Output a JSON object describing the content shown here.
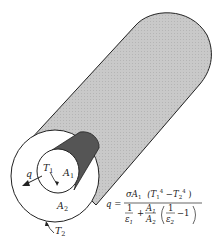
{
  "diagram": {
    "labels": {
      "heat_flow": "q",
      "inner_temp": "T",
      "inner_temp_sub": "1",
      "inner_area": "A",
      "inner_area_sub": "1",
      "outer_area": "A",
      "outer_area_sub": "2",
      "outer_temp": "T",
      "outer_temp_sub": "2"
    },
    "equation": {
      "lhs": "q =",
      "numerator": "σA₁ (T₁⁴ − T₂⁴)",
      "num_sigma_a": "σA",
      "num_sigma_a_sub": "1",
      "num_paren_open": "(T",
      "num_t1_sub": "1",
      "num_t1_sup": "4",
      "num_minus": " −T",
      "num_t2_sub": "2",
      "num_t2_sup": "4",
      "num_paren_close": ")",
      "den_one": "1",
      "den_eps1": "ε",
      "den_eps1_sub": "1",
      "den_plus": "+",
      "den_a1": "A",
      "den_a1_sub": "1",
      "den_a2": "A",
      "den_a2_sub": "2",
      "den_inner_one": "1",
      "den_eps2": "ε",
      "den_eps2_sub": "2",
      "den_minus_one": "−1"
    },
    "colors": {
      "outer_surface": "#c8c8c8",
      "inner_surface": "#555555",
      "annulus": "#ffffff",
      "stroke": "#222222"
    }
  }
}
